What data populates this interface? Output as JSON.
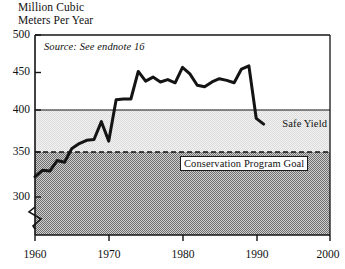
{
  "chart_data": {
    "type": "line",
    "title_line1": "Million Cubic",
    "title_line2": "Meters Per Year",
    "xlabel": "",
    "ylabel": "Million Cubic Meters Per Year",
    "xlim": [
      1960,
      2000
    ],
    "ylim": [
      285,
      500
    ],
    "y_axis_break": true,
    "grid": false,
    "legend_position": "inline-annotations",
    "annotations": [
      {
        "name": "source-note",
        "text": "Source: See endnote 16"
      },
      {
        "name": "safe-yield-label",
        "text": "Safe Yield",
        "value": 415
      },
      {
        "name": "conservation-goal-label",
        "text": "Conservation Program Goal",
        "value": 370
      }
    ],
    "yticks": [
      300,
      350,
      400,
      450,
      500
    ],
    "ytick_labels": [
      "300",
      "350",
      "400",
      "450",
      "500"
    ],
    "xticks": [
      1960,
      1970,
      1980,
      1990,
      2000
    ],
    "xtick_labels": [
      "1960",
      "1970",
      "1980",
      "1990",
      "2000"
    ],
    "reference_lines": [
      {
        "name": "safe-yield-line",
        "label": "Safe Yield",
        "value": 415,
        "style": "solid"
      },
      {
        "name": "conservation-program-goal-line",
        "label": "Conservation Program Goal",
        "value": 370,
        "style": "dashed"
      }
    ],
    "shaded_regions": [
      {
        "name": "safe-yield-band",
        "from": 370,
        "to": 415,
        "fill": "#e8e8e8"
      },
      {
        "name": "below-goal-region",
        "from": 285,
        "to": 370,
        "fill": "#a8a8a8"
      }
    ],
    "series": [
      {
        "name": "Groundwater Withdrawal",
        "x": [
          1960,
          1961,
          1962,
          1963,
          1964,
          1965,
          1966,
          1967,
          1968,
          1969,
          1970,
          1971,
          1972,
          1973,
          1974,
          1975,
          1976,
          1977,
          1978,
          1979,
          1980,
          1981,
          1982,
          1983,
          1984,
          1985,
          1986,
          1987,
          1988,
          1989,
          1990,
          1991
        ],
        "values": [
          325,
          333,
          332,
          345,
          343,
          360,
          366,
          370,
          371,
          393,
          369,
          420,
          421,
          421,
          455,
          443,
          448,
          442,
          445,
          441,
          460,
          452,
          438,
          436,
          442,
          446,
          444,
          441,
          458,
          462,
          397,
          390
        ]
      }
    ],
    "colors": {
      "line": "#141414",
      "safe_yield_band": "#e8e8e8",
      "below_goal": "#a8a8a8",
      "axis": "#141414"
    }
  }
}
